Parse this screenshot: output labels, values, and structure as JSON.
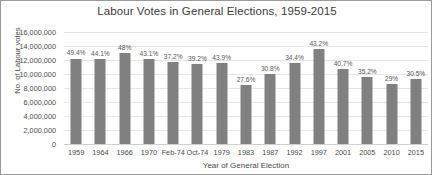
{
  "chart_data": {
    "type": "bar",
    "title": "Labour Votes in General Elections, 1959-2015",
    "xlabel": "Year of General Election",
    "ylabel": "No. of Labour votes",
    "categories": [
      "1959",
      "1964",
      "1966",
      "1970",
      "Feb-74",
      "Oct-74",
      "1979",
      "1983",
      "1987",
      "1992",
      "1997",
      "2001",
      "2005",
      "2010",
      "2015"
    ],
    "values": [
      12216172,
      12205814,
      13064951,
      12208758,
      11645616,
      11457079,
      11532218,
      8456934,
      10029807,
      11560484,
      13518167,
      10724953,
      9552436,
      8609527,
      9347304
    ],
    "point_labels": [
      "49.4%",
      "44.1%",
      "48%",
      "43.1%",
      "37.2%",
      "39.2%",
      "43.9%",
      "27.6%",
      "30.8%",
      "34.4%",
      "43.2%",
      "40.7%",
      "35.2%",
      "29%",
      "30.5%"
    ],
    "ylim": [
      0,
      16000000
    ],
    "ytick_labels": [
      "16,000,000",
      "14,000,000",
      "12,000,000",
      "10,000,000",
      "8,000,000",
      "6,000,000",
      "4,000,000",
      "2,000,000",
      "0"
    ],
    "ytick_values": [
      16000000,
      14000000,
      12000000,
      10000000,
      8000000,
      6000000,
      4000000,
      2000000,
      0
    ],
    "grid": true,
    "legend": false,
    "bar_color": "#808080",
    "background_color": "#ffffff"
  }
}
